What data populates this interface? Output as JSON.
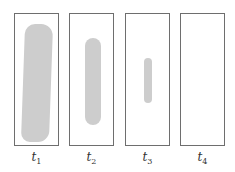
{
  "diagram": {
    "panels": [
      {
        "id": "t1",
        "label": "t",
        "subscript": "1"
      },
      {
        "id": "t2",
        "label": "t",
        "subscript": "2"
      },
      {
        "id": "t3",
        "label": "t",
        "subscript": "3"
      },
      {
        "id": "t4",
        "label": "t",
        "subscript": "4"
      }
    ],
    "colors": {
      "border": "#6e6e6e",
      "blob": "#cdcdcd"
    }
  }
}
